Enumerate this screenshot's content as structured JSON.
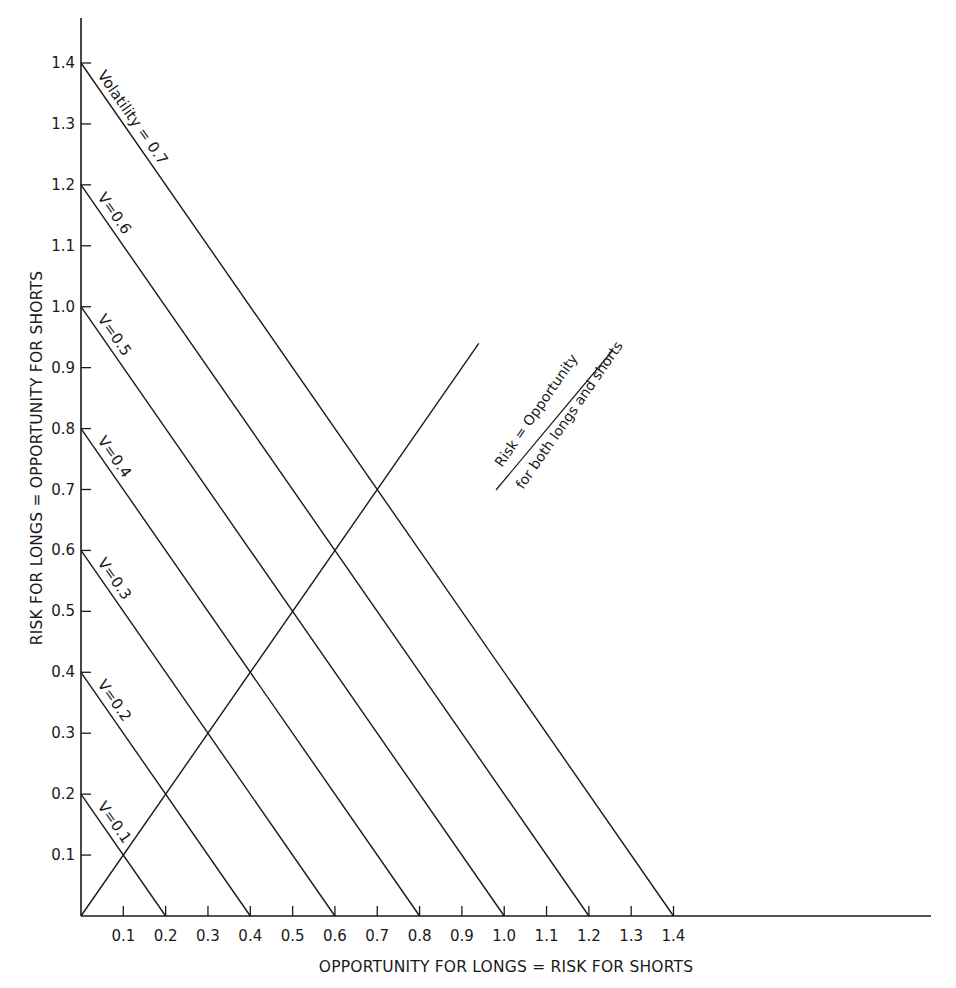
{
  "chart_data": {
    "type": "line",
    "title": "",
    "xlabel": "OPPORTUNITY FOR LONGS = RISK FOR SHORTS",
    "ylabel": "RISK FOR LONGS = OPPORTUNITY FOR SHORTS",
    "xlim": [
      0,
      1.4
    ],
    "ylim": [
      0,
      1.4
    ],
    "grid": false,
    "legend": "none (lines labeled inline)",
    "x_ticks": [
      "0.1",
      "0.2",
      "0.3",
      "0.4",
      "0.5",
      "0.6",
      "0.7",
      "0.8",
      "0.9",
      "1.0",
      "1.1",
      "1.2",
      "1.3",
      "1.4"
    ],
    "y_ticks": [
      "0.1",
      "0.2",
      "0.3",
      "0.4",
      "0.5",
      "0.6",
      "0.7",
      "0.8",
      "0.9",
      "1.0",
      "1.1",
      "1.2",
      "1.3",
      "1.4"
    ],
    "series": [
      {
        "name": "V = 0.1",
        "label": "V=0.1",
        "x": [
          0,
          0.2
        ],
        "y": [
          0.2,
          0
        ]
      },
      {
        "name": "V = 0.2",
        "label": "V=0.2",
        "x": [
          0,
          0.4
        ],
        "y": [
          0.4,
          0
        ]
      },
      {
        "name": "V = 0.3",
        "label": "V=0.3",
        "x": [
          0,
          0.6
        ],
        "y": [
          0.6,
          0
        ]
      },
      {
        "name": "V = 0.4",
        "label": "V=0.4",
        "x": [
          0,
          0.8
        ],
        "y": [
          0.8,
          0
        ]
      },
      {
        "name": "V = 0.5",
        "label": "V=0.5",
        "x": [
          0,
          1.0
        ],
        "y": [
          1.0,
          0
        ]
      },
      {
        "name": "V = 0.6",
        "label": "V=0.6",
        "x": [
          0,
          1.2
        ],
        "y": [
          1.2,
          0
        ]
      },
      {
        "name": "Volatility = 0.7",
        "label": "Volatility = 0.7",
        "x": [
          0,
          1.4
        ],
        "y": [
          1.4,
          0
        ]
      },
      {
        "name": "Risk = Opportunity for both longs and shorts",
        "label_line1": "Risk = Opportunity",
        "label_line2": "for both longs and shorts",
        "x": [
          0,
          0.94
        ],
        "y": [
          0,
          0.94
        ]
      }
    ],
    "annotations": [
      "Volatility = 0.7",
      "V=0.6",
      "V=0.5",
      "V=0.4",
      "V=0.3",
      "V=0.2",
      "V=0.1",
      "Risk = Opportunity",
      "for both longs and shorts"
    ]
  },
  "colors": {
    "ink": "#1a1a1a",
    "background": "#ffffff"
  }
}
